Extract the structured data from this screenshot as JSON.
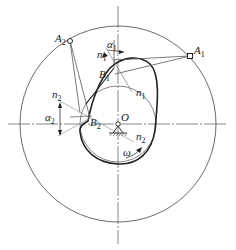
{
  "diagram": {
    "type": "cam-mechanism",
    "colors": {
      "stroke": "#333333",
      "thin": "#555555",
      "light": "#999999",
      "background": "#ffffff"
    },
    "labels": {
      "A1": {
        "main": "A",
        "sub": "1"
      },
      "A2": {
        "main": "A",
        "sub": "2"
      },
      "B1": {
        "main": "B",
        "sub": "1"
      },
      "B2": {
        "main": "B",
        "sub": "2"
      },
      "n1_top": {
        "main": "n",
        "sub": "1"
      },
      "n1_bottom": {
        "main": "n",
        "sub": "1"
      },
      "n2_left": {
        "main": "n",
        "sub": "2"
      },
      "n2_right": {
        "main": "n",
        "sub": "2"
      },
      "alpha1": {
        "main": "α",
        "sub": "1"
      },
      "alpha2": {
        "main": "α",
        "sub": "2"
      },
      "O": {
        "main": "O"
      },
      "omega": {
        "main": "ω"
      }
    }
  }
}
